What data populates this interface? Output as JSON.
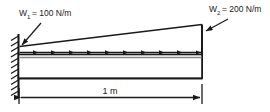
{
  "diagram": {
    "type": "engineering-beam-load-diagram",
    "colors": {
      "line": "#1a1a1a",
      "beam_fill": "#ffffff",
      "beam_inner": "#8a8a8a",
      "background": "#ffffff"
    },
    "labels": {
      "load_left": "W",
      "load_left_sub": "1",
      "load_left_value": "= 100 N/m",
      "load_left_full": "W₁ = 100 N/m",
      "load_right": "W",
      "load_right_sub": "2",
      "load_right_value": "= 200 N/m",
      "load_right_full": "W₂ = 200 N/m",
      "span": "1 m"
    },
    "support": {
      "kind": "fixed-wall",
      "side": "left",
      "hatch_count": 11
    },
    "load": {
      "kind": "linearly-varying-distributed",
      "direction": "horizontal-right",
      "arrow_count": 10,
      "start_intensity": "100 N/m",
      "end_intensity": "200 N/m"
    },
    "dimension": {
      "value": "1 m",
      "style": "double-headed-arrow"
    }
  }
}
